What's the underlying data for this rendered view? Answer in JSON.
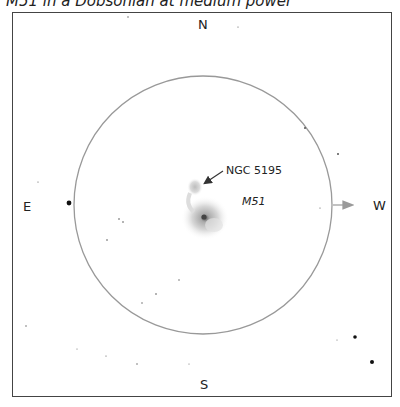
{
  "caption": "M51 in a Dobsonian at medium power",
  "directions": {
    "north": "N",
    "south": "S",
    "east": "E",
    "west": "W"
  },
  "objects": {
    "companion": "NGC 5195",
    "galaxy": "M51"
  },
  "field_of_view": {
    "center": [
      203,
      205
    ],
    "radius": 129,
    "stroke": "#999999"
  },
  "motion_arrow": {
    "label": "drift-west-arrow",
    "color": "#9a9a9a"
  },
  "stars": [
    {
      "x": 69,
      "y": 203,
      "r": 2.4
    },
    {
      "x": 355,
      "y": 337,
      "r": 1.8
    },
    {
      "x": 372,
      "y": 362,
      "r": 2.0
    },
    {
      "x": 305,
      "y": 128,
      "r": 1.0
    },
    {
      "x": 338,
      "y": 154,
      "r": 1.0
    },
    {
      "x": 119,
      "y": 219,
      "r": 0.8
    },
    {
      "x": 123,
      "y": 222,
      "r": 0.8
    },
    {
      "x": 107,
      "y": 240,
      "r": 0.8
    },
    {
      "x": 156,
      "y": 294,
      "r": 0.8
    },
    {
      "x": 142,
      "y": 303,
      "r": 0.7
    },
    {
      "x": 179,
      "y": 280,
      "r": 0.7
    },
    {
      "x": 26,
      "y": 326,
      "r": 0.7
    },
    {
      "x": 137,
      "y": 364,
      "r": 0.7
    },
    {
      "x": 106,
      "y": 356,
      "r": 0.6
    },
    {
      "x": 128,
      "y": 17,
      "r": 0.7
    },
    {
      "x": 238,
      "y": 27,
      "r": 0.6
    },
    {
      "x": 38,
      "y": 182,
      "r": 0.6
    },
    {
      "x": 320,
      "y": 208,
      "r": 0.6
    },
    {
      "x": 77,
      "y": 349,
      "r": 0.5
    },
    {
      "x": 189,
      "y": 364,
      "r": 0.5
    },
    {
      "x": 337,
      "y": 340,
      "r": 0.5
    }
  ]
}
